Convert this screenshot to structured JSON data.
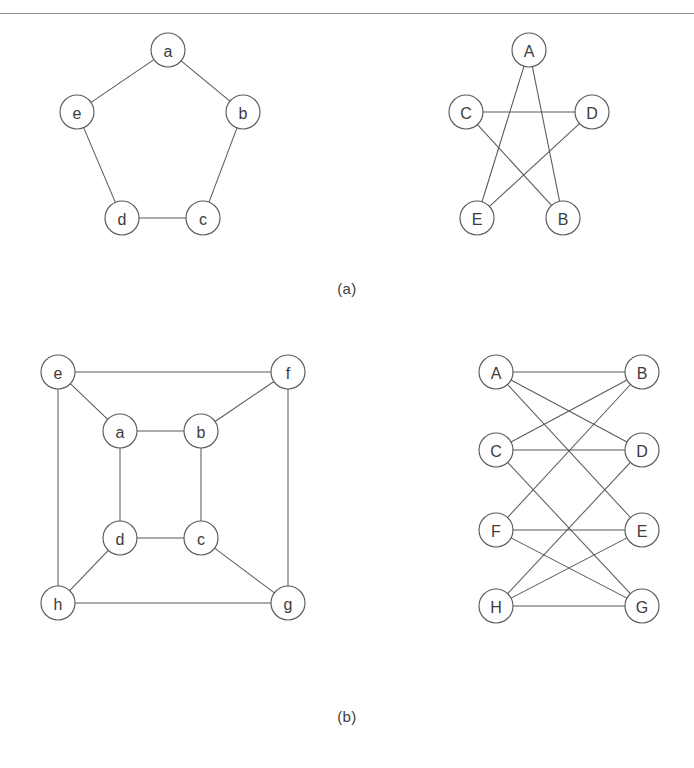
{
  "page": {
    "background_color": "#ffffff",
    "rule_color": "#8e8e8e",
    "ink_color": "#5a5a5a",
    "label_color": "#3c3c3c"
  },
  "figures": [
    {
      "id": "a",
      "caption": "(a)",
      "graphs": [
        {
          "id": "a-left",
          "name": "pentagon-cycle-graph",
          "node_radius": 17,
          "nodes": [
            {
              "label": "a",
              "x": 168,
              "y": 28
            },
            {
              "label": "b",
              "x": 243,
              "y": 90
            },
            {
              "label": "c",
              "x": 203,
              "y": 196
            },
            {
              "label": "d",
              "x": 122,
              "y": 196
            },
            {
              "label": "e",
              "x": 77,
              "y": 90
            }
          ],
          "edges": [
            [
              "a",
              "b"
            ],
            [
              "b",
              "c"
            ],
            [
              "c",
              "d"
            ],
            [
              "d",
              "e"
            ],
            [
              "e",
              "a"
            ]
          ]
        },
        {
          "id": "a-right",
          "name": "pentagram-star-graph",
          "node_radius": 17,
          "nodes": [
            {
              "label": "A",
              "x": 529,
              "y": 28
            },
            {
              "label": "B",
              "x": 563,
              "y": 196
            },
            {
              "label": "C",
              "x": 466,
              "y": 90
            },
            {
              "label": "D",
              "x": 592,
              "y": 90
            },
            {
              "label": "E",
              "x": 477,
              "y": 196
            }
          ],
          "edges": [
            [
              "A",
              "B"
            ],
            [
              "A",
              "E"
            ],
            [
              "C",
              "D"
            ],
            [
              "C",
              "B"
            ],
            [
              "D",
              "E"
            ]
          ]
        }
      ]
    },
    {
      "id": "b",
      "caption": "(b)",
      "graphs": [
        {
          "id": "b-left",
          "name": "cube-nested-square-graph",
          "node_radius": 17,
          "nodes": [
            {
              "label": "a",
              "x": 120,
              "y": 91
            },
            {
              "label": "b",
              "x": 201,
              "y": 91
            },
            {
              "label": "c",
              "x": 201,
              "y": 198
            },
            {
              "label": "d",
              "x": 120,
              "y": 198
            },
            {
              "label": "e",
              "x": 58,
              "y": 32
            },
            {
              "label": "f",
              "x": 288,
              "y": 32
            },
            {
              "label": "g",
              "x": 288,
              "y": 263
            },
            {
              "label": "h",
              "x": 58,
              "y": 263
            }
          ],
          "edges": [
            [
              "a",
              "b"
            ],
            [
              "b",
              "c"
            ],
            [
              "c",
              "d"
            ],
            [
              "d",
              "a"
            ],
            [
              "e",
              "f"
            ],
            [
              "f",
              "g"
            ],
            [
              "g",
              "h"
            ],
            [
              "h",
              "e"
            ],
            [
              "e",
              "a"
            ],
            [
              "f",
              "b"
            ],
            [
              "g",
              "c"
            ],
            [
              "h",
              "d"
            ]
          ]
        },
        {
          "id": "b-right",
          "name": "cube-bipartite-ladder-graph",
          "node_radius": 17,
          "nodes": [
            {
              "label": "A",
              "x": 496,
              "y": 32
            },
            {
              "label": "B",
              "x": 642,
              "y": 32
            },
            {
              "label": "C",
              "x": 496,
              "y": 110
            },
            {
              "label": "D",
              "x": 642,
              "y": 110
            },
            {
              "label": "F",
              "x": 496,
              "y": 190
            },
            {
              "label": "E",
              "x": 642,
              "y": 190
            },
            {
              "label": "H",
              "x": 496,
              "y": 266
            },
            {
              "label": "G",
              "x": 642,
              "y": 266
            }
          ],
          "edges": [
            [
              "A",
              "B"
            ],
            [
              "A",
              "D"
            ],
            [
              "A",
              "E"
            ],
            [
              "B",
              "C"
            ],
            [
              "B",
              "F"
            ],
            [
              "C",
              "D"
            ],
            [
              "C",
              "G"
            ],
            [
              "D",
              "H"
            ],
            [
              "F",
              "E"
            ],
            [
              "F",
              "G"
            ],
            [
              "E",
              "H"
            ],
            [
              "H",
              "G"
            ]
          ]
        }
      ]
    }
  ]
}
